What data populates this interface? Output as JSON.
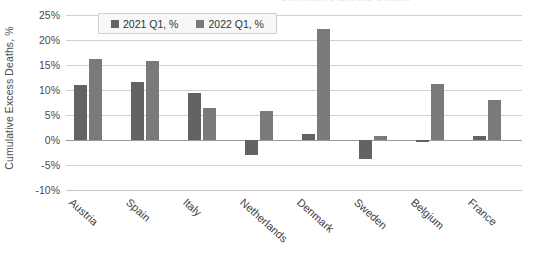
{
  "chart_data": {
    "type": "bar",
    "title": "Cumulative Excess Deaths",
    "xlabel": "",
    "ylabel": "Cumulative Excess Deaths, %",
    "ylim": [
      -10,
      25
    ],
    "ytick_labels": [
      "25%",
      "20%",
      "15%",
      "10%",
      "5%",
      "0%",
      "-5%",
      "-10%"
    ],
    "ytick_values": [
      25,
      20,
      15,
      10,
      5,
      0,
      -5,
      -10
    ],
    "grid": true,
    "legend_position": "top-center",
    "categories": [
      "Austria",
      "Spain",
      "Italy",
      "Netherlands",
      "Denmark",
      "Sweden",
      "Belgium",
      "France"
    ],
    "series": [
      {
        "name": "2021 Q1, %",
        "color": "#636363",
        "values": [
          11.0,
          11.7,
          9.4,
          -3.0,
          1.2,
          -3.8,
          -0.3,
          0.8
        ]
      },
      {
        "name": "2022 Q1, %",
        "color": "#7a7a7a",
        "values": [
          16.2,
          15.8,
          6.5,
          5.8,
          22.2,
          0.8,
          11.3,
          8.0
        ]
      }
    ]
  },
  "legend": {
    "items": [
      {
        "label": "2021 Q1, %",
        "color": "#636363"
      },
      {
        "label": "2022 Q1, %",
        "color": "#7a7a7a"
      }
    ]
  }
}
